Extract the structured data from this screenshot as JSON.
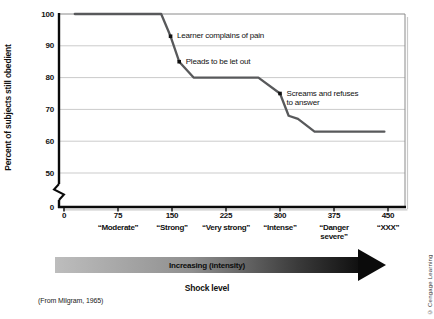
{
  "figure": {
    "source_note": "(From Milgram, 1965)",
    "credit": "© Cengage Learning"
  },
  "chart_data": {
    "type": "line",
    "title": "",
    "ylabel": "Percent of subjects still obedient",
    "xlabel": "Shock level",
    "arrow_label": "Increasing (intensity)",
    "xlim": [
      0,
      450
    ],
    "ylim_displayed": [
      50,
      100
    ],
    "y_axis_break_to_zero": true,
    "grid": "horizontal",
    "y_ticks": [
      "100",
      "90",
      "80",
      "70",
      "60",
      "50",
      "0"
    ],
    "y_tick_values": [
      100,
      90,
      80,
      70,
      60,
      50,
      0
    ],
    "x_ticks": [
      {
        "value": 0,
        "label": "0",
        "word_lines": []
      },
      {
        "value": 75,
        "label": "75",
        "word_lines": [
          "“Moderate”"
        ]
      },
      {
        "value": 150,
        "label": "150",
        "word_lines": [
          "“Strong”"
        ]
      },
      {
        "value": 225,
        "label": "225",
        "word_lines": [
          "“Very strong”"
        ]
      },
      {
        "value": 300,
        "label": "300",
        "word_lines": [
          "“Intense”"
        ]
      },
      {
        "value": 375,
        "label": "375",
        "word_lines": [
          "“Danger",
          "severe”"
        ]
      },
      {
        "value": 450,
        "label": "450",
        "word_lines": [
          "“XXX”"
        ]
      }
    ],
    "series": [
      {
        "name": "percent-still-obedient",
        "points": [
          [
            15,
            100
          ],
          [
            135,
            100
          ],
          [
            148,
            93
          ],
          [
            160,
            85
          ],
          [
            180,
            80
          ],
          [
            270,
            80
          ],
          [
            300,
            75
          ],
          [
            312,
            68
          ],
          [
            325,
            67
          ],
          [
            348,
            63
          ],
          [
            445,
            63
          ]
        ]
      }
    ],
    "annotations": [
      {
        "x": 148,
        "y": 93,
        "lines": [
          "Learner complains of pain"
        ]
      },
      {
        "x": 160,
        "y": 85,
        "lines": [
          "Pleads to be let out"
        ]
      },
      {
        "x": 300,
        "y": 75,
        "lines": [
          "Screams and refuses",
          "to answer"
        ]
      }
    ],
    "colors": {
      "line": "#58595b",
      "grid": "#cbcbcb",
      "axis": "#0a0a0a",
      "frame": "#8a8a8a",
      "frame_shadow": "#c9c9c9",
      "marker": "#111111",
      "arrow_start": "#bdbdbd",
      "arrow_end": "#0b0b0b"
    }
  }
}
